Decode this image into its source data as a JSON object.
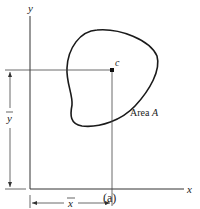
{
  "figure": {
    "caption": "(a)",
    "axes": {
      "x_label": "x",
      "y_label": "y"
    },
    "centroid": {
      "label": "c"
    },
    "region": {
      "label_prefix": "Area ",
      "label_var": "A"
    },
    "dimensions": {
      "x_bar": "x",
      "y_bar": "y"
    },
    "colors": {
      "stroke": "#222222",
      "guide": "#555555",
      "background": "#ffffff"
    }
  }
}
